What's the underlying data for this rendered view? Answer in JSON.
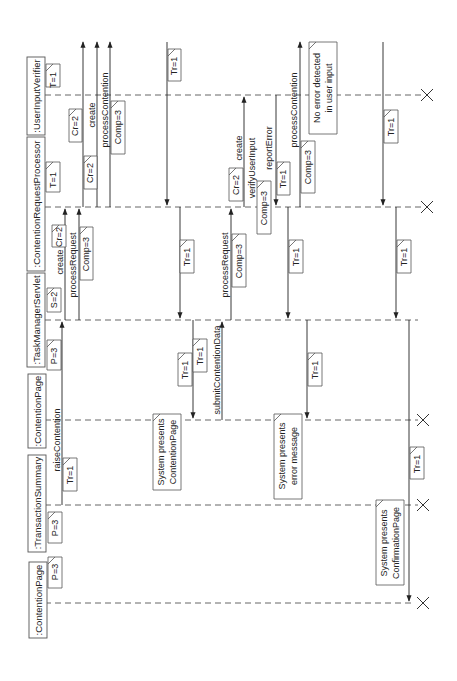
{
  "diagram": {
    "type": "sequence-diagram",
    "orientation": "rotated-90-ccw",
    "lifelines": [
      {
        "id": "L0",
        "label": ":UserInputVerifier",
        "tag": "T=1"
      },
      {
        "id": "L1",
        "label": ":ContentionRequestProcessor",
        "tag": "T=1"
      },
      {
        "id": "L2",
        "label": ":TaskManagerServlet",
        "tag": "S=2"
      },
      {
        "id": "L3",
        "label": ":ContentionPage",
        "tag": "P=3"
      },
      {
        "id": "L4",
        "label": ":TransactionSummary",
        "tag": "P=3"
      },
      {
        "id": "L5",
        "label": ":ContentionPage",
        "tag": "P=3"
      }
    ],
    "messages": [
      {
        "label": "raiseContention",
        "from": "L4",
        "to": "L2",
        "tag": "Tr=1"
      },
      {
        "label": "create",
        "from": "L2",
        "to": "L1",
        "tag": "Cr=2"
      },
      {
        "label": "processRequest",
        "from": "L2",
        "to": "L1",
        "tag": "Comp=3"
      },
      {
        "label": "create",
        "from": "L1",
        "to": "L0",
        "tag": "Cr=2"
      },
      {
        "label": "create",
        "from": "L1",
        "to": "L0",
        "tag": "Cr=2"
      },
      {
        "label": "processContention",
        "from": "L1",
        "to": "L0",
        "tag": "Comp=3"
      },
      {
        "label": "",
        "from": "L0",
        "to": "L1",
        "tag": "Tr=1"
      },
      {
        "label": "",
        "from": "L1",
        "to": "L2",
        "tag": "Tr=1"
      },
      {
        "label": "",
        "from": "L2",
        "to": "L3",
        "tag": "Tr=1"
      },
      {
        "label": "",
        "from": "L2",
        "to": "L3",
        "tag": "Tr=1"
      },
      {
        "label": "submitContentionData",
        "from": "L3",
        "to": "L2",
        "tag": ""
      },
      {
        "label": "processRequest",
        "from": "L2",
        "to": "L1",
        "tag": "Comp=3"
      },
      {
        "label": "create",
        "from": "L1",
        "to": "L0",
        "tag": "Cr=2"
      },
      {
        "label": "verifyUserInput",
        "from": "L1",
        "to": "L0",
        "tag": "Comp=3"
      },
      {
        "label": "reportError",
        "from": "L0",
        "to": "L1",
        "tag": "Tr=1"
      },
      {
        "label": "processContention",
        "from": "L1",
        "to": "L0",
        "tag": "Comp=3"
      },
      {
        "label": "",
        "from": "L1",
        "to": "L2",
        "tag": "Tr=1"
      },
      {
        "label": "",
        "from": "L2",
        "to": "L3",
        "tag": "Tr=1"
      },
      {
        "label": "",
        "from": "L0",
        "to": "L1",
        "tag": "Tr=1"
      },
      {
        "label": "",
        "from": "L1",
        "to": "L2",
        "tag": "Tr=1"
      },
      {
        "label": "",
        "from": "L2",
        "to": "L5",
        "tag": "Tr=1"
      }
    ],
    "notes": {
      "presents_contention": [
        "System presents",
        "ContentionPage"
      ],
      "presents_error": [
        "System presents",
        "error message"
      ],
      "no_error": [
        "No error detected",
        "in user input"
      ],
      "presents_confirmation": [
        "System presents",
        "ConfirmationPage"
      ]
    }
  }
}
